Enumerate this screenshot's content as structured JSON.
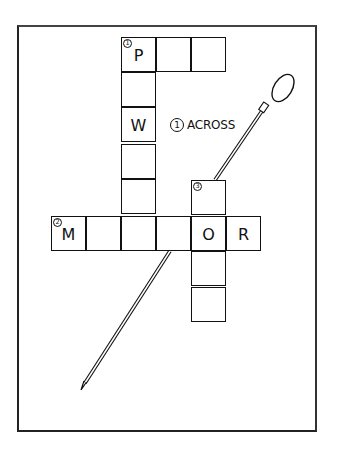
{
  "diagram": {
    "type": "crossword-illustration",
    "frame": {
      "x": 17,
      "y": 25,
      "width": 300,
      "height": 407
    },
    "cell_size": 35,
    "clue_label": {
      "number": "1",
      "text": "ACROSS"
    },
    "cells": [
      {
        "id": "r0c0",
        "x": 121,
        "y": 37,
        "letter": "P",
        "number": "1"
      },
      {
        "id": "r0c1",
        "x": 156,
        "y": 37,
        "letter": "",
        "number": ""
      },
      {
        "id": "r0c2",
        "x": 191,
        "y": 37,
        "letter": "",
        "number": ""
      },
      {
        "id": "r1c0",
        "x": 121,
        "y": 72,
        "letter": "",
        "number": ""
      },
      {
        "id": "r2c0",
        "x": 121,
        "y": 107,
        "letter": "W",
        "number": ""
      },
      {
        "id": "r3c0",
        "x": 121,
        "y": 144,
        "letter": "",
        "number": ""
      },
      {
        "id": "r3c2",
        "x": 191,
        "y": 180,
        "letter": "",
        "number": "3"
      },
      {
        "id": "r4c0",
        "x": 121,
        "y": 179,
        "letter": "",
        "number": ""
      },
      {
        "id": "a0",
        "x": 51,
        "y": 216,
        "letter": "M",
        "number": "2"
      },
      {
        "id": "a1",
        "x": 86,
        "y": 216,
        "letter": "",
        "number": ""
      },
      {
        "id": "a2",
        "x": 121,
        "y": 216,
        "letter": "",
        "number": ""
      },
      {
        "id": "a3",
        "x": 156,
        "y": 216,
        "letter": "",
        "number": ""
      },
      {
        "id": "a4",
        "x": 191,
        "y": 216,
        "letter": "O",
        "number": ""
      },
      {
        "id": "a5",
        "x": 226,
        "y": 216,
        "letter": "R",
        "number": ""
      },
      {
        "id": "d1",
        "x": 191,
        "y": 251,
        "letter": "",
        "number": ""
      },
      {
        "id": "d2",
        "x": 191,
        "y": 287,
        "letter": "",
        "number": ""
      }
    ],
    "pin": {
      "head": {
        "cx": 283,
        "cy": 88,
        "rx": 9,
        "ry": 15,
        "rotate": 32
      },
      "collar": {
        "x1": 262,
        "y1": 110,
        "x2": 268,
        "y2": 103
      },
      "shaft_top": {
        "x": 264,
        "y": 108
      },
      "shaft_mid_enter": {
        "x": 215,
        "y": 180
      },
      "shaft_mid_exit": {
        "x": 170,
        "y": 251
      },
      "tip": {
        "x": 81,
        "y": 390
      }
    },
    "colors": {
      "ink": "#111111",
      "paper": "#ffffff",
      "frame": "#222222"
    }
  }
}
